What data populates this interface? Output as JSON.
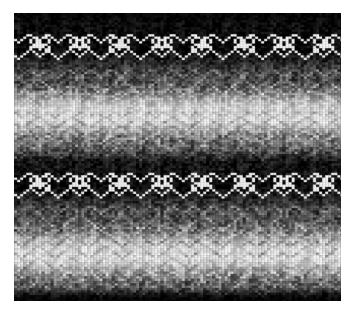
{
  "image": {
    "subject": "knitted-fabric-swatch",
    "description": "Grayscale machine-knit fabric swatch with horizontal gradient bands and two rows of white heart motifs",
    "canvas_width": 350,
    "canvas_height": 314,
    "background_color": "#ffffff",
    "swatch": {
      "left": 14,
      "top": 13,
      "width": 327,
      "height": 288,
      "border_color": "#000000"
    },
    "palette": {
      "darkest": "#050505",
      "dark": "#1a1a1a",
      "mid_dark": "#4a4a4a",
      "mid": "#8a8a8a",
      "mid_light": "#c0c0c0",
      "light": "#e8e8e8",
      "white": "#ffffff"
    },
    "stitch": {
      "column_width_px": 3.05,
      "row_height_px": 2.35,
      "columns": 107,
      "rows": 123,
      "shape": "v-knit-stitch"
    },
    "bands": [
      {
        "name": "top-dark-band",
        "y_start": 0,
        "y_end": 14,
        "tone": 0.06
      },
      {
        "name": "heart-row-1-dark-bg",
        "y_start": 14,
        "y_end": 52,
        "tone": 0.04
      },
      {
        "name": "gradient-up-1",
        "y_start": 52,
        "y_end": 78,
        "tone": 0.3
      },
      {
        "name": "light-band-1",
        "y_start": 78,
        "y_end": 118,
        "tone": 0.88
      },
      {
        "name": "chevron-light-1",
        "y_start": 96,
        "y_end": 118,
        "tone": 0.93
      },
      {
        "name": "gradient-down-1",
        "y_start": 118,
        "y_end": 142,
        "tone": 0.45
      },
      {
        "name": "mid-dark-band",
        "y_start": 142,
        "y_end": 158,
        "tone": 0.1
      },
      {
        "name": "heart-row-2-dark-bg",
        "y_start": 150,
        "y_end": 192,
        "tone": 0.05
      },
      {
        "name": "gradient-up-2",
        "y_start": 192,
        "y_end": 214,
        "tone": 0.32
      },
      {
        "name": "light-band-2",
        "y_start": 214,
        "y_end": 262,
        "tone": 0.9
      },
      {
        "name": "chevron-light-2",
        "y_start": 228,
        "y_end": 258,
        "tone": 0.94
      },
      {
        "name": "gradient-down-2",
        "y_start": 262,
        "y_end": 282,
        "tone": 0.4
      },
      {
        "name": "bottom-dark-band",
        "y_start": 282,
        "y_end": 288,
        "tone": 0.07
      }
    ],
    "heart_rows": [
      {
        "name": "heart-row-top",
        "center_y": 33,
        "motif_count": 16,
        "motif_pitch_px": 20.4,
        "stroke_color": "#ffffff",
        "background": "#060606"
      },
      {
        "name": "heart-row-bottom",
        "center_y": 172,
        "motif_count": 16,
        "motif_pitch_px": 20.4,
        "stroke_color": "#ffffff",
        "background": "#060606"
      }
    ],
    "motif": {
      "type": "heart-with-small-heart",
      "large_heart_width_px": 13,
      "large_heart_height_px": 11,
      "small_heart_width_px": 7,
      "small_heart_height_px": 6
    }
  }
}
